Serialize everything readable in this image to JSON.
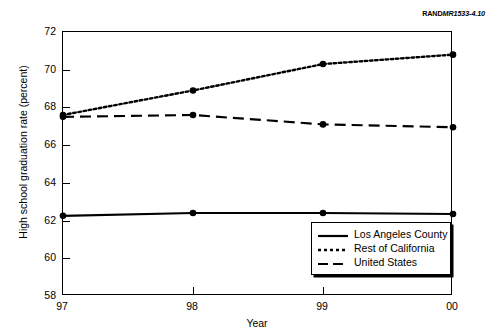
{
  "source_credit": {
    "brand": "RAND",
    "document": "MR1533-4.10"
  },
  "chart_data": {
    "type": "line",
    "title": "",
    "xlabel": "Year",
    "ylabel": "High school graduation rate (percent)",
    "categories": [
      "97",
      "98",
      "99",
      "00"
    ],
    "x_tick_labels": [
      "97",
      "98",
      "99",
      "00"
    ],
    "y_tick_labels": [
      "58",
      "60",
      "62",
      "64",
      "66",
      "68",
      "70",
      "72"
    ],
    "ylim": [
      58,
      72
    ],
    "ytick_step": 2,
    "grid": false,
    "legend_position": "bottom-right",
    "series": [
      {
        "name": "Los Angeles County",
        "style": "solid",
        "markers": true,
        "values": [
          62.25,
          62.4,
          62.4,
          62.35
        ]
      },
      {
        "name": "Rest of California",
        "style": "dotted",
        "markers": true,
        "values": [
          67.6,
          68.9,
          70.3,
          70.8
        ]
      },
      {
        "name": "United States",
        "style": "dashed",
        "markers": true,
        "values": [
          67.5,
          67.6,
          67.1,
          66.95
        ]
      }
    ]
  }
}
